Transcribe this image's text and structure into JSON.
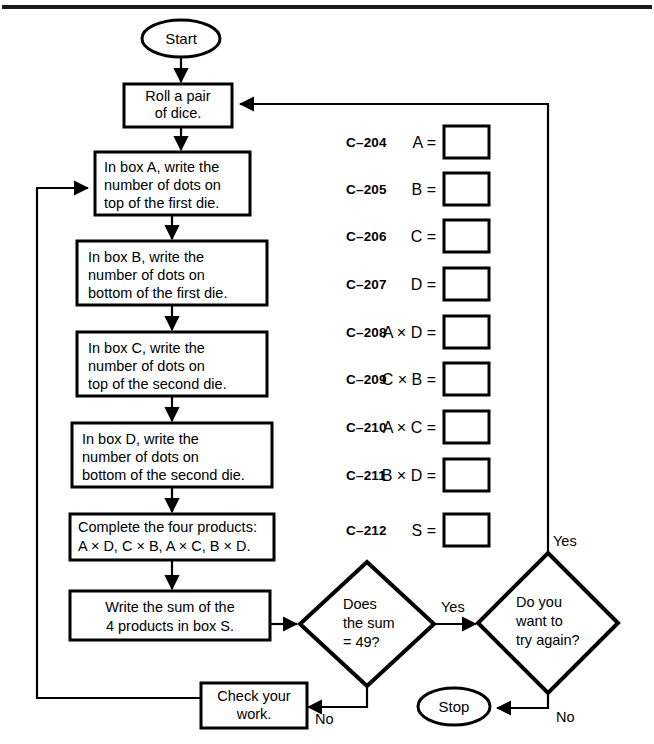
{
  "page": {
    "width": 654,
    "height": 744,
    "ink_color": "#000000",
    "paper_color": "#ffffff"
  },
  "flowchart": {
    "start_label": "Start",
    "stop_label": "Stop",
    "steps": [
      {
        "id": "roll",
        "lines": [
          "Roll a pair",
          "of dice."
        ]
      },
      {
        "id": "box-a",
        "lines": [
          "In box A, write the",
          "number of dots on",
          "top of the first die."
        ]
      },
      {
        "id": "box-b",
        "lines": [
          "In box B, write the",
          "number of dots on",
          "bottom of the first die."
        ]
      },
      {
        "id": "box-c",
        "lines": [
          "In box C, write the",
          "number of dots on",
          "top of the second die."
        ]
      },
      {
        "id": "box-d",
        "lines": [
          "In box D, write the",
          "number of dots on",
          "bottom of the second die."
        ]
      },
      {
        "id": "products",
        "lines": [
          "Complete the four products:",
          "A × D, C × B, A × C, B × D."
        ]
      },
      {
        "id": "sum",
        "lines": [
          "Write the sum of the",
          "4 products in box S."
        ]
      },
      {
        "id": "check",
        "lines": [
          "Check your",
          "work."
        ]
      }
    ],
    "decisions": [
      {
        "id": "sum-check",
        "lines": [
          "Does",
          "the sum",
          "= 49?"
        ]
      },
      {
        "id": "try-again",
        "lines": [
          "Do you",
          "want to",
          "try again?"
        ]
      }
    ],
    "branch_labels": {
      "sum_yes": "Yes",
      "sum_no": "No",
      "again_yes": "Yes",
      "again_no": "No"
    }
  },
  "answer_items": [
    {
      "code": "C–204",
      "expr": "A =",
      "value": ""
    },
    {
      "code": "C–205",
      "expr": "B =",
      "value": ""
    },
    {
      "code": "C–206",
      "expr": "C =",
      "value": ""
    },
    {
      "code": "C–207",
      "expr": "D =",
      "value": ""
    },
    {
      "code": "C–208",
      "expr": "A × D =",
      "value": ""
    },
    {
      "code": "C–209",
      "expr": "C × B =",
      "value": ""
    },
    {
      "code": "C–210",
      "expr": "A × C =",
      "value": ""
    },
    {
      "code": "C–211",
      "expr": "B × D =",
      "value": ""
    },
    {
      "code": "C–212",
      "expr": "S =",
      "value": ""
    }
  ]
}
